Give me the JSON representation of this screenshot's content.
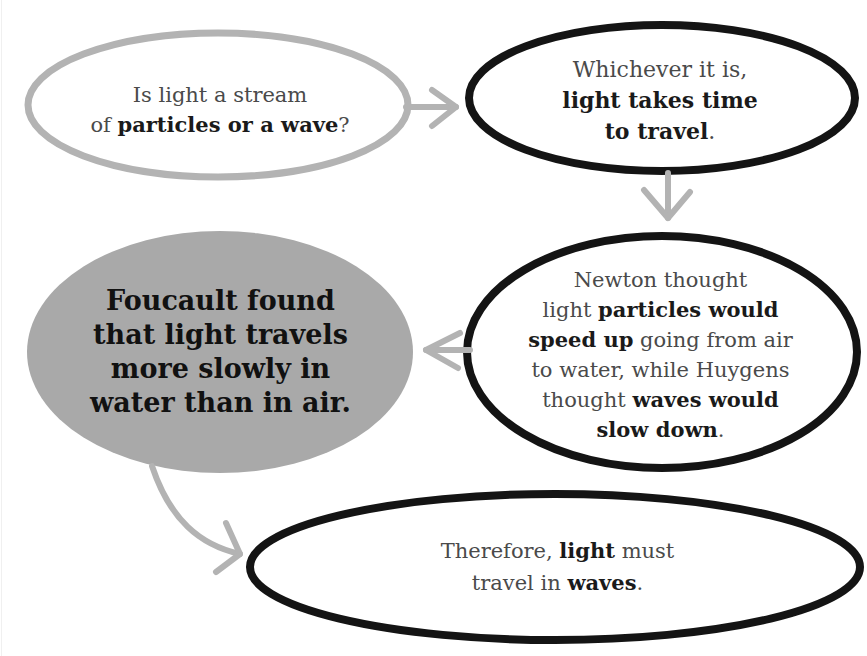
{
  "diagram": {
    "type": "flowchart",
    "colors": {
      "gray_stroke": "#b3b3b3",
      "black_stroke": "#141414",
      "gray_fill": "#a9a9a9",
      "text": "#4a4a4a",
      "bold_text": "#1a1a1a"
    },
    "nodes": [
      {
        "id": "question",
        "style": "gray-outline",
        "line1": "Is light a stream",
        "line2_pre": "of ",
        "line2_bold": "particles or a wave",
        "line2_post": "?"
      },
      {
        "id": "time",
        "style": "black-outline",
        "line1": "Whichever it is,",
        "line2_bold": "light takes time",
        "line3_bold": "to travel",
        "line3_post": "."
      },
      {
        "id": "theories",
        "style": "black-outline",
        "line1": "Newton thought",
        "line2_pre": "light ",
        "line2_bold": "particles would",
        "line3_bold": "speed up",
        "line3_post": " going from air",
        "line4": "to water, while Huygens",
        "line5_pre": "thought ",
        "line5_bold": "waves would",
        "line6_bold": "slow down",
        "line6_post": "."
      },
      {
        "id": "foucault",
        "style": "gray-filled",
        "line1": "Foucault found",
        "line2": "that light travels",
        "line3": "more slowly in",
        "line4": "water than in air."
      },
      {
        "id": "conclusion",
        "style": "black-outline",
        "line1_pre": "Therefore, ",
        "line1_bold": "light",
        "line1_post": " must",
        "line2_pre": "travel in ",
        "line2_bold": "waves",
        "line2_post": "."
      }
    ],
    "edges": [
      {
        "from": "question",
        "to": "time",
        "direction": "right"
      },
      {
        "from": "time",
        "to": "theories",
        "direction": "down"
      },
      {
        "from": "theories",
        "to": "foucault",
        "direction": "left"
      },
      {
        "from": "foucault",
        "to": "conclusion",
        "direction": "curved-down-right"
      }
    ]
  }
}
